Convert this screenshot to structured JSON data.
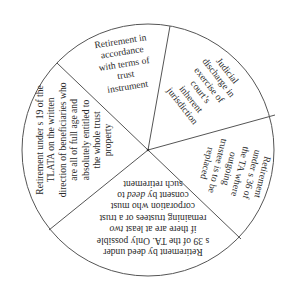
{
  "diagram": {
    "type": "pie-segmented-text-diagram",
    "center": {
      "x": 148,
      "y": 150
    },
    "radius": 126,
    "stroke_color": "#555555",
    "fill_color": "#ffffff",
    "dividers": [
      {
        "x": 170,
        "y": 26
      },
      {
        "x": 275,
        "y": 115
      },
      {
        "x": 241,
        "y": 239
      },
      {
        "x": 49,
        "y": 230
      },
      {
        "x": 57,
        "y": 63
      }
    ],
    "segments": [
      {
        "id": "trust-instrument",
        "lines": [
          "Retirement in",
          "accordance",
          "with terms of",
          "trust",
          "instrument"
        ]
      },
      {
        "id": "judicial-discharge",
        "lines": [
          "Judicial",
          "discharge in",
          "exercise of",
          "court’s",
          "inherent",
          "jurisdiction"
        ]
      },
      {
        "id": "s36-replacement",
        "lines": [
          "Retirement",
          "under s 36 of",
          "the TA where",
          "outgoing",
          "trustee is to be",
          "replaced"
        ]
      },
      {
        "id": "s39-deed",
        "lines": [
          "Retirement by deed under",
          "s 39 of the TA. Only possible",
          "if there are at least ",
          "remaining trustees or a trust",
          "corporation who must",
          "consent by ",
          "such retirement"
        ],
        "italic_words": {
          "two": "two",
          "deed": "deed"
        },
        "line3_suffix": "two",
        "line6_suffix": " to"
      },
      {
        "id": "s19-tlata",
        "lines": [
          "Retirement under s 19 of the",
          "TLATA on the written",
          "direction of beneficiaries who",
          "are all of full age and",
          "absolutely entitled to",
          "the whole trust",
          "property"
        ]
      }
    ]
  }
}
